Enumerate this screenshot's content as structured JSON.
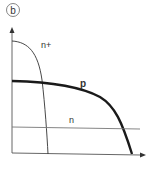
{
  "figure": {
    "panel_label": "b",
    "colors": {
      "axis": "#555555",
      "curve": "#222222",
      "text": "#333333"
    }
  },
  "diagram": {
    "axes": {
      "x_arrow": true,
      "y_arrow": true
    },
    "curves": [
      {
        "name": "n+",
        "label": "n+",
        "style": "thin"
      },
      {
        "name": "p",
        "label": "p",
        "style": "thick"
      },
      {
        "name": "n",
        "label": "n",
        "style": "thin-horizontal"
      }
    ]
  }
}
